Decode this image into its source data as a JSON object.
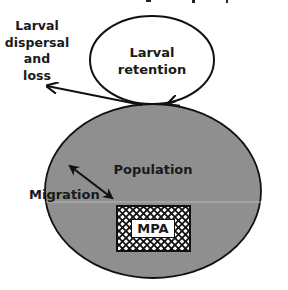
{
  "diagram": {
    "colors": {
      "population_fill": "#8f8f8f",
      "outline": "#111111",
      "background": "#ffffff",
      "divider_line": "#b8b8b8"
    },
    "nodes": {
      "larval_retention": {
        "line1": "Larval",
        "line2": "retention"
      },
      "population": {
        "label": "Population"
      },
      "mpa": {
        "label": "MPA"
      }
    },
    "edges": {
      "dispersal": {
        "line1": "Larval",
        "line2": "dispersal",
        "line3": "and",
        "line4": "loss"
      },
      "migration": {
        "label": "Migration"
      }
    }
  }
}
